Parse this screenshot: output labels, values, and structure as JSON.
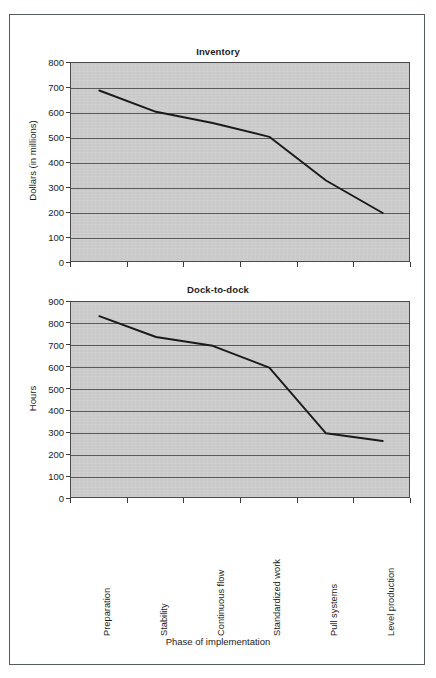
{
  "figure": {
    "background": "#ffffff",
    "frame_color": "#555a5d",
    "plot_background": "#c9c9c9",
    "gridline_color": "#5a5a5a",
    "line_color": "#1a1a1a"
  },
  "shared": {
    "categories": [
      "Preparation",
      "Stability",
      "Continuous flow",
      "Standardized work",
      "Pull systems",
      "Level production"
    ],
    "xlabel": "Phase of implementation"
  },
  "chart_data": [
    {
      "type": "line",
      "title": "Inventory",
      "xlabel": "",
      "ylabel": "Dollars (in millions)",
      "categories": [
        "Preparation",
        "Stability",
        "Continuous flow",
        "Standardized work",
        "Pull systems",
        "Level production"
      ],
      "values": [
        690,
        605,
        560,
        505,
        330,
        200
      ],
      "ylim": [
        0,
        800
      ],
      "yticks": [
        0,
        100,
        200,
        300,
        400,
        500,
        600,
        700,
        800
      ],
      "ytick_labels": [
        "0",
        "100",
        "200",
        "300",
        "400",
        "500",
        "600",
        "700",
        "800"
      ],
      "grid": true,
      "legend": "none"
    },
    {
      "type": "line",
      "title": "Dock-to-dock",
      "xlabel": "Phase of implementation",
      "ylabel": "Hours",
      "categories": [
        "Preparation",
        "Stability",
        "Continuous flow",
        "Standardized work",
        "Pull systems",
        "Level production"
      ],
      "values": [
        835,
        740,
        700,
        600,
        300,
        265
      ],
      "ylim": [
        0,
        900
      ],
      "yticks": [
        0,
        100,
        200,
        300,
        400,
        500,
        600,
        700,
        800,
        900
      ],
      "ytick_labels": [
        "0",
        "100",
        "200",
        "300",
        "400",
        "500",
        "600",
        "700",
        "800",
        "900"
      ],
      "grid": true,
      "legend": "none"
    }
  ]
}
